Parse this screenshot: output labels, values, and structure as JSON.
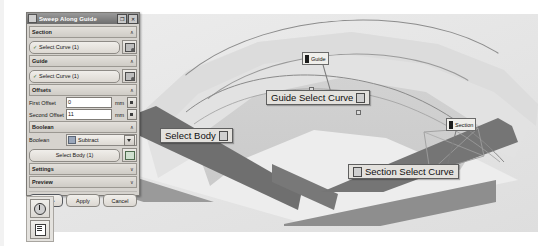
{
  "window": {
    "title": "Sweep Along Guide",
    "icon": "window-menu-icon",
    "restore_label": "❐",
    "close_label": "✕"
  },
  "dialog": {
    "sections": [
      {
        "key": "section",
        "header": "Section",
        "chevron": "∧",
        "select_label": "Select Curve (1)",
        "select_tick": "✓",
        "side_icon": "curve-rule-icon"
      },
      {
        "key": "guide",
        "header": "Guide",
        "chevron": "∧",
        "select_label": "Select Curve (1)",
        "select_tick": "✓",
        "side_icon": "curve-rule-icon"
      }
    ],
    "offsets": {
      "header": "Offsets",
      "chevron": "∧",
      "fields": [
        {
          "label": "First Offset",
          "value": "0",
          "unit": "mm",
          "spin_icon": "spin-button-icon"
        },
        {
          "label": "Second Offset",
          "value": "11",
          "unit": "mm",
          "spin_icon": "spin-button-icon"
        }
      ]
    },
    "boolean": {
      "header": "Boolean",
      "chevron": "∧",
      "field_label": "Boolean",
      "selected_option": "Subtract",
      "options": [
        "None",
        "Unite",
        "Subtract",
        "Intersect"
      ],
      "combo_icon": "subtract-boolean-icon",
      "arrow_icon": "chevron-down-icon",
      "select_body_label": "Select Body (1)",
      "body_side_icon": "body-rule-icon"
    },
    "collapsed": [
      {
        "key": "settings",
        "header": "Settings",
        "chevron": "∨"
      },
      {
        "key": "preview",
        "header": "Preview",
        "chevron": "∨"
      }
    ],
    "footer": {
      "ok": "< OK >",
      "apply": "Apply",
      "cancel": "Cancel"
    }
  },
  "mini_toolbar": {
    "buttons": [
      {
        "name": "history-dial-icon"
      },
      {
        "name": "list-panel-icon"
      }
    ]
  },
  "viewport": {
    "callouts": [
      {
        "key": "guide_select_curve",
        "text": "Guide Select Curve",
        "handle_icon": "drag-handle-icon"
      },
      {
        "key": "select_body",
        "text": "Select Body",
        "handle_icon": "drag-handle-icon"
      },
      {
        "key": "section_select_curve",
        "text": "Section Select Curve",
        "handle_icon": "drag-handle-icon"
      }
    ],
    "tags": [
      {
        "key": "guide_tag",
        "text": "Guide",
        "marker_icon": "tag-marker-icon"
      },
      {
        "key": "section_tag",
        "text": "Section",
        "marker_icon": "tag-marker-icon"
      }
    ],
    "colors": {
      "background": "#e9e9e9",
      "slab_top": "#ededed",
      "slab_side": "#9a9a9a",
      "sweep_top": "#dcdcdc",
      "sweep_face": "#6f6f6f",
      "curve": "#8d8d8d"
    }
  }
}
